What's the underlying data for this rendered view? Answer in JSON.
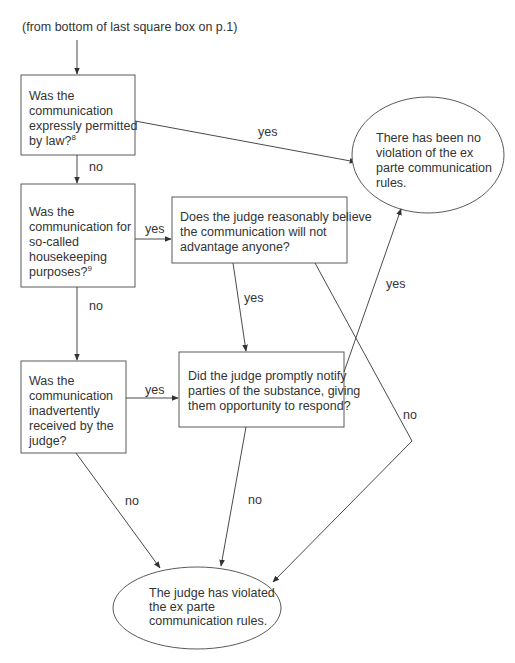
{
  "diagram": {
    "entry_note": "(from bottom of last square box on p.1)",
    "nodes": {
      "q_permitted": {
        "lines": [
          "Was the",
          "communication",
          "expressly permitted",
          "by law?"
        ],
        "footnote": "8"
      },
      "q_housekeeping": {
        "lines": [
          "Was the",
          "communication for",
          "so-called",
          "housekeeping",
          "purposes?"
        ],
        "footnote": "9"
      },
      "q_advantage": {
        "lines": [
          "Does the judge reasonably believe",
          "the communication will not",
          "advantage anyone?"
        ]
      },
      "q_inadvertent": {
        "lines": [
          "Was the",
          "communication",
          "inadvertently",
          "received by the",
          "judge?"
        ]
      },
      "q_notify": {
        "lines": [
          "Did the judge promptly notify",
          "parties of the substance, giving",
          "them opportunity to respond?"
        ]
      },
      "r_no_violation": {
        "lines": [
          "There has been no",
          "violation of the ex",
          "parte communication",
          "rules."
        ]
      },
      "r_violated": {
        "lines": [
          "The judge has violated",
          "the ex parte",
          "communication rules."
        ]
      }
    },
    "edges": {
      "permitted_yes": "yes",
      "permitted_no": "no",
      "housekeeping_yes": "yes",
      "housekeeping_no": "no",
      "advantage_yes": "yes",
      "advantage_no": "no",
      "inadvertent_yes": "yes",
      "inadvertent_no": "no",
      "notify_yes": "yes",
      "notify_no": "no"
    }
  }
}
